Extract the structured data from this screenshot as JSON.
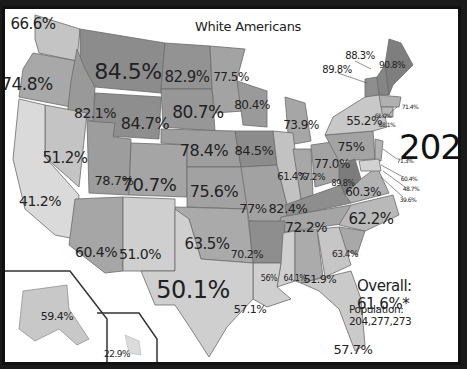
{
  "title": "White Americans",
  "year": "2020",
  "overall": "Overall: 61.6%*",
  "population": "Population: 204,277,273",
  "colors": {
    "background": "#ffffff",
    "frame": "#111111",
    "darkest": "#7a7a7a",
    "dark": "#8f8f8f",
    "mid": "#a6a6a6",
    "light": "#c2c2c2",
    "lightest": "#d9d9d9"
  },
  "states": [
    {
      "code": "WA",
      "value": "66.6%",
      "x": 28,
      "y": 15,
      "size": 15
    },
    {
      "code": "OR",
      "value": "74.8%",
      "x": 22,
      "y": 75,
      "size": 17
    },
    {
      "code": "ID",
      "value": "82.1%",
      "x": 90,
      "y": 104,
      "size": 14
    },
    {
      "code": "MT",
      "value": "84.5%",
      "x": 123,
      "y": 63,
      "size": 22
    },
    {
      "code": "ND",
      "value": "82.9%",
      "x": 182,
      "y": 68,
      "size": 15
    },
    {
      "code": "MN",
      "value": "77.5%",
      "x": 226,
      "y": 68,
      "size": 12
    },
    {
      "code": "WY",
      "value": "84.7%",
      "x": 140,
      "y": 115,
      "size": 16
    },
    {
      "code": "SD",
      "value": "80.7%",
      "x": 193,
      "y": 103,
      "size": 17
    },
    {
      "code": "WI",
      "value": "80.4%",
      "x": 247,
      "y": 96,
      "size": 12
    },
    {
      "code": "MI",
      "value": "73.9%",
      "x": 296,
      "y": 116,
      "size": 12
    },
    {
      "code": "NV",
      "value": "51.2%",
      "x": 60,
      "y": 149,
      "size": 15
    },
    {
      "code": "CA",
      "value": "41.2%",
      "x": 35,
      "y": 192,
      "size": 14
    },
    {
      "code": "UT",
      "value": "78.7%",
      "x": 109,
      "y": 171,
      "size": 13
    },
    {
      "code": "CO",
      "value": "70.7%",
      "x": 144,
      "y": 176,
      "size": 18
    },
    {
      "code": "NE",
      "value": "78.4%",
      "x": 199,
      "y": 142,
      "size": 16
    },
    {
      "code": "IA",
      "value": "84.5%",
      "x": 249,
      "y": 141,
      "size": 13
    },
    {
      "code": "KS",
      "value": "75.6%",
      "x": 209,
      "y": 183,
      "size": 16
    },
    {
      "code": "MO",
      "value": "77%",
      "x": 248,
      "y": 199,
      "size": 13
    },
    {
      "code": "IL",
      "value": "61.4%",
      "x": 287,
      "y": 168,
      "size": 10
    },
    {
      "code": "IN",
      "value": "77.2%",
      "x": 307,
      "y": 168,
      "size": 9
    },
    {
      "code": "OH",
      "value": "77.0%",
      "x": 327,
      "y": 155,
      "size": 12
    },
    {
      "code": "PA",
      "value": "75%",
      "x": 346,
      "y": 137,
      "size": 13
    },
    {
      "code": "NY",
      "value": "55.2%",
      "x": 359,
      "y": 112,
      "size": 12
    },
    {
      "code": "KY",
      "value": "82.4%",
      "x": 283,
      "y": 199,
      "size": 13
    },
    {
      "code": "WV",
      "value": "89.8%",
      "x": 338,
      "y": 175,
      "size": 8
    },
    {
      "code": "VA",
      "value": "60.3%",
      "x": 358,
      "y": 183,
      "size": 12
    },
    {
      "code": "NC",
      "value": "62.2%",
      "x": 366,
      "y": 210,
      "size": 15
    },
    {
      "code": "TN",
      "value": "72.2%",
      "x": 301,
      "y": 218,
      "size": 14
    },
    {
      "code": "AZ",
      "value": "60.4%",
      "x": 91,
      "y": 243,
      "size": 14
    },
    {
      "code": "NM",
      "value": "51.0%",
      "x": 135,
      "y": 245,
      "size": 14
    },
    {
      "code": "OK",
      "value": "63.5%",
      "x": 202,
      "y": 235,
      "size": 15
    },
    {
      "code": "AR",
      "value": "70.2%",
      "x": 242,
      "y": 245,
      "size": 11
    },
    {
      "code": "TX",
      "value": "50.1%",
      "x": 188,
      "y": 281,
      "size": 24
    },
    {
      "code": "LA",
      "value": "57.1%",
      "x": 245,
      "y": 300,
      "size": 11
    },
    {
      "code": "MS",
      "value": "56%",
      "x": 264,
      "y": 270,
      "size": 8
    },
    {
      "code": "AL",
      "value": "64.1%",
      "x": 290,
      "y": 270,
      "size": 8
    },
    {
      "code": "GA",
      "value": "51.9%",
      "x": 315,
      "y": 270,
      "size": 11
    },
    {
      "code": "SC",
      "value": "63.4%",
      "x": 340,
      "y": 245,
      "size": 9
    },
    {
      "code": "FL",
      "value": "57.7%",
      "x": 348,
      "y": 340,
      "size": 13
    },
    {
      "code": "AK",
      "value": "59.4%",
      "x": 52,
      "y": 307,
      "size": 11
    },
    {
      "code": "HI",
      "value": "22.9%",
      "x": 112,
      "y": 345,
      "size": 9
    },
    {
      "code": "ME",
      "value": "90.8%",
      "x": 387,
      "y": 56,
      "size": 9
    },
    {
      "code": "NH",
      "value": "88.3%",
      "x": 355,
      "y": 47,
      "size": 10
    },
    {
      "code": "VT",
      "value": "89.8%",
      "x": 332,
      "y": 61,
      "size": 10
    },
    {
      "code": "MA",
      "value": "71.4%",
      "x": 405,
      "y": 98,
      "size": 6
    },
    {
      "code": "CT",
      "value": "65.0%",
      "x": 378,
      "y": 107,
      "size": 6
    },
    {
      "code": "RI",
      "value": "68.1%",
      "x": 382,
      "y": 116,
      "size": 6
    },
    {
      "code": "NJ",
      "value": "71.3%",
      "x": 400,
      "y": 152,
      "size": 6
    },
    {
      "code": "DE",
      "value": "60.4%",
      "x": 404,
      "y": 170,
      "size": 6
    },
    {
      "code": "MD",
      "value": "48.7%",
      "x": 406,
      "y": 180,
      "size": 6
    },
    {
      "code": "DC",
      "value": "39.6%",
      "x": 403,
      "y": 191,
      "size": 6
    }
  ]
}
